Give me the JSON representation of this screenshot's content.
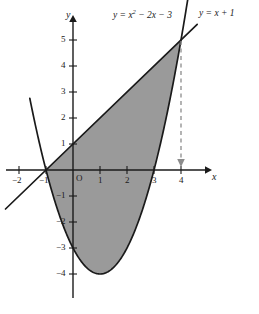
{
  "figure": {
    "background_color": "#ffffff",
    "shade_color": "#9a9a9a",
    "curve_color": "#1a1a1a",
    "axis_color": "#1a1a1a",
    "dashed_color": "#8c8c8c"
  },
  "axes": {
    "x_axis_name": "x",
    "y_axis_name": "y",
    "origin_label": "O",
    "x_ticks": [
      {
        "value": -2,
        "label": "−2"
      },
      {
        "value": -1,
        "label": "−1"
      },
      {
        "value": 1,
        "label": "1"
      },
      {
        "value": 2,
        "label": "2"
      },
      {
        "value": 3,
        "label": "3"
      },
      {
        "value": 4,
        "label": "4"
      }
    ],
    "y_ticks": [
      {
        "value": 5,
        "label": "5"
      },
      {
        "value": 4,
        "label": "4"
      },
      {
        "value": 3,
        "label": "3"
      },
      {
        "value": 2,
        "label": "2"
      },
      {
        "value": 1,
        "label": "1"
      },
      {
        "value": -1,
        "label": "−1"
      },
      {
        "value": -2,
        "label": "−2"
      },
      {
        "value": -3,
        "label": "−3"
      },
      {
        "value": -4,
        "label": "−4"
      }
    ]
  },
  "labels": {
    "parabola_prefix": "y = x",
    "parabola_exponent": "2",
    "parabola_suffix": " − 2x − 3",
    "line_label": "y = x + 1"
  },
  "chart_data": {
    "type": "line",
    "title": "",
    "xlabel": "x",
    "ylabel": "y",
    "xlim": [
      -2.7,
      5.0
    ],
    "ylim": [
      -4.9,
      5.7
    ],
    "grid": false,
    "legend": "inline-labels",
    "series": [
      {
        "name": "y = x^2 - 2x - 3",
        "type": "parabola",
        "equation": "y = x^2 - 2x - 3",
        "vertex": [
          1,
          -4
        ],
        "roots": [
          -1,
          3
        ],
        "y_intercept": -3,
        "domain": [
          -1.6,
          4.3
        ],
        "points": [
          [
            -1.6,
            2.76
          ],
          [
            -1.4,
            1.76
          ],
          [
            -1.2,
            0.84
          ],
          [
            -1.0,
            0.0
          ],
          [
            -0.8,
            -0.76
          ],
          [
            -0.6,
            -1.44
          ],
          [
            -0.4,
            -2.04
          ],
          [
            -0.2,
            -2.56
          ],
          [
            0.0,
            -3.0
          ],
          [
            0.2,
            -3.36
          ],
          [
            0.4,
            -3.64
          ],
          [
            0.6,
            -3.84
          ],
          [
            0.8,
            -3.96
          ],
          [
            1.0,
            -4.0
          ],
          [
            1.2,
            -3.96
          ],
          [
            1.4,
            -3.84
          ],
          [
            1.6,
            -3.64
          ],
          [
            1.8,
            -3.36
          ],
          [
            2.0,
            -3.0
          ],
          [
            2.2,
            -2.56
          ],
          [
            2.4,
            -2.04
          ],
          [
            2.6,
            -1.44
          ],
          [
            2.8,
            -0.76
          ],
          [
            3.0,
            0.0
          ],
          [
            3.2,
            0.84
          ],
          [
            3.4,
            1.76
          ],
          [
            3.6,
            2.76
          ],
          [
            3.8,
            3.84
          ],
          [
            4.0,
            5.0
          ],
          [
            4.2,
            6.24
          ],
          [
            4.3,
            6.89
          ]
        ]
      },
      {
        "name": "y = x + 1",
        "type": "line",
        "equation": "y = x + 1",
        "slope": 1,
        "intercept": 1,
        "x_intercept": -1,
        "domain": [
          -2.5,
          4.6
        ],
        "points": [
          [
            -2.5,
            -1.5
          ],
          [
            4.6,
            5.6
          ]
        ]
      }
    ],
    "intersections": [
      {
        "x": -1,
        "y": 0
      },
      {
        "x": 4,
        "y": 5
      }
    ],
    "shaded_region": {
      "description": "Region between the line y = x + 1 (upper) and the parabola y = x^2 - 2x - 3 (lower) from x = -1 to x = 4",
      "x_from": -1,
      "x_to": 4,
      "upper": "y = x + 1",
      "lower": "y = x^2 - 2x - 3",
      "fill": "#9a9a9a"
    },
    "annotations": [
      {
        "name": "dashed-drop-line",
        "from": [
          4,
          5
        ],
        "to": [
          4,
          0
        ],
        "style": "dashed",
        "arrow": "down"
      }
    ]
  }
}
